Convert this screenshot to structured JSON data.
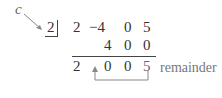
{
  "diagram": {
    "c_label": "c",
    "divisor": "2",
    "rows": {
      "coefficients": [
        "2",
        "−4",
        "0",
        "5"
      ],
      "products": [
        "",
        "4",
        "0",
        "0"
      ],
      "results": [
        "2",
        "0",
        "0",
        "5"
      ]
    },
    "remainder_label": "remainder",
    "colors": {
      "text": "#333333",
      "annotation": "#777777",
      "arrow": "#888888"
    }
  }
}
